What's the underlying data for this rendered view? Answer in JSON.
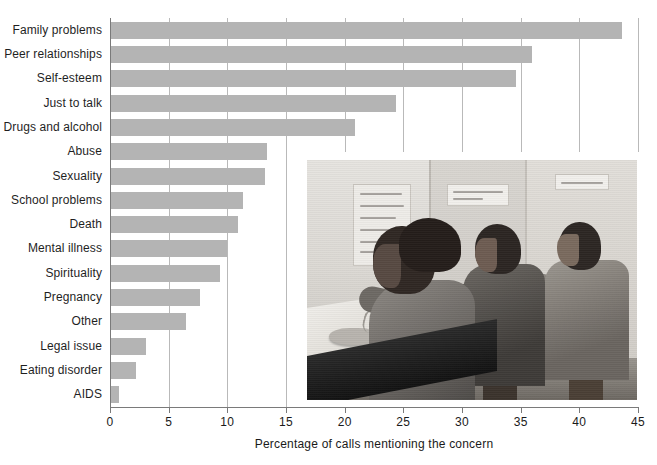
{
  "chart_data": {
    "type": "bar",
    "orientation": "horizontal",
    "title": "",
    "xlabel": "Percentage of calls mentioning the concern",
    "ylabel": "",
    "xlim": [
      0,
      45
    ],
    "xticks": [
      0,
      5,
      10,
      15,
      20,
      25,
      30,
      35,
      40,
      45
    ],
    "grid": true,
    "legend": null,
    "bar_color": "#b4b4b4",
    "categories": [
      "Family problems",
      "Peer relationships",
      "Self-esteem",
      "Just to talk",
      "Drugs and alcohol",
      "Abuse",
      "Sexuality",
      "School problems",
      "Death",
      "Mental illness",
      "Spirituality",
      "Pregnancy",
      "Other",
      "Legal issue",
      "Eating disorder",
      "AIDS"
    ],
    "values": [
      43.6,
      36.0,
      34.6,
      24.4,
      20.9,
      13.4,
      13.2,
      11.3,
      10.9,
      10.0,
      9.4,
      7.7,
      6.5,
      3.1,
      2.2,
      0.8
    ]
  },
  "axis": {
    "x_tick_labels": [
      "0",
      "5",
      "10",
      "15",
      "20",
      "25",
      "30",
      "35",
      "40",
      "45"
    ],
    "x_title": "Percentage of calls mentioning the concern"
  },
  "photo": {
    "caption": "",
    "description": "Black-and-white photograph of three teenagers answering phones at a crisis hotline call center",
    "signs": [
      "LISTEN WITH CARE SAVE A LIFE!",
      "SUICIDE HOT LINE"
    ]
  },
  "colors": {
    "bar": "#b4b4b4",
    "grid": "#b9b9b9",
    "axis": "#7a7a7a",
    "text": "#1a1a1a",
    "background": "#ffffff"
  }
}
